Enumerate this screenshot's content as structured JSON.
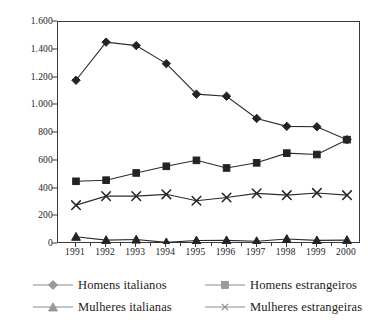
{
  "chart_data": {
    "type": "line",
    "title": "",
    "subtitle": "",
    "xlabel": "",
    "ylabel": "",
    "x": [
      "1991",
      "1992",
      "1993",
      "1994",
      "1995",
      "1996",
      "1997",
      "1998",
      "1999",
      "2000"
    ],
    "categories": [
      "1991",
      "1992",
      "1993",
      "1994",
      "1995",
      "1996",
      "1997",
      "1998",
      "1999",
      "2000"
    ],
    "ylim": [
      0,
      1600
    ],
    "ytick_values": [
      0,
      200,
      400,
      600,
      800,
      1000,
      1200,
      1400,
      1600
    ],
    "ytick_labels": [
      "0",
      "200",
      "400",
      "600",
      "800",
      "1.000",
      "1.200",
      "1.400",
      "1.600"
    ],
    "grid": false,
    "legend_position": "bottom",
    "series": [
      {
        "name": "Homens italianos",
        "marker": "diamond",
        "values": [
          1180,
          1455,
          1430,
          1300,
          1080,
          1065,
          905,
          848,
          845,
          752
        ]
      },
      {
        "name": "Homens estrangeiros",
        "marker": "square",
        "values": [
          452,
          460,
          512,
          560,
          603,
          548,
          585,
          655,
          645,
          752
        ]
      },
      {
        "name": "Mulheres italianas",
        "marker": "triangle",
        "values": [
          52,
          28,
          32,
          12,
          25,
          26,
          20,
          36,
          26,
          28
        ]
      },
      {
        "name": "Mulheres estrangeiras",
        "marker": "cross",
        "values": [
          280,
          345,
          345,
          358,
          312,
          335,
          365,
          352,
          368,
          352
        ]
      }
    ]
  },
  "legend": {
    "items": [
      {
        "label": "Homens italianos",
        "marker": "diamond"
      },
      {
        "label": "Homens estrangeiros",
        "marker": "square"
      },
      {
        "label": "Mulheres italianas",
        "marker": "triangle"
      },
      {
        "label": "Mulheres estrangeiras",
        "marker": "cross"
      }
    ]
  },
  "colors": {
    "line": "#2b2b2b",
    "marker": "#232323",
    "legend_marker": "#9a9a9a",
    "legend_line": "#8c8c8c",
    "axis": "#3a3a3a",
    "text": "#1a1a1a",
    "background": "#ffffff"
  }
}
